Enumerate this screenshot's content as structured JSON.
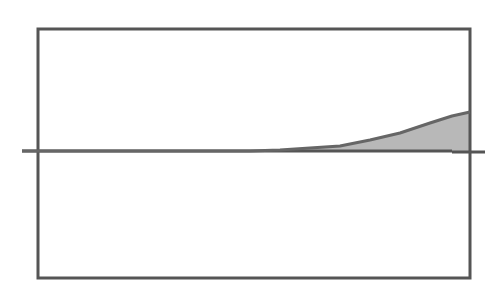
{
  "diagram": {
    "type": "curve-with-shaded-area",
    "frame": {
      "x": 38,
      "y": 29,
      "width": 432,
      "height": 249,
      "stroke": "#555555",
      "stroke_width": 3
    },
    "axis": {
      "y": 151,
      "left_start": 22,
      "main_end": 452,
      "right_tick_start": 452,
      "right_tick_end": 485,
      "stroke": "#555555",
      "stroke_width": 3
    },
    "curve": {
      "stroke": "#666666",
      "stroke_width": 3,
      "points": [
        [
          22,
          151
        ],
        [
          250,
          151
        ],
        [
          280,
          150
        ],
        [
          310,
          148
        ],
        [
          340,
          146
        ],
        [
          370,
          140
        ],
        [
          400,
          133
        ],
        [
          430,
          123
        ],
        [
          452,
          116
        ],
        [
          470,
          112
        ]
      ]
    },
    "shaded_region": {
      "fill": "#b8b8b8",
      "from_x": 260,
      "to_x": 470,
      "baseline_y": 151
    }
  }
}
